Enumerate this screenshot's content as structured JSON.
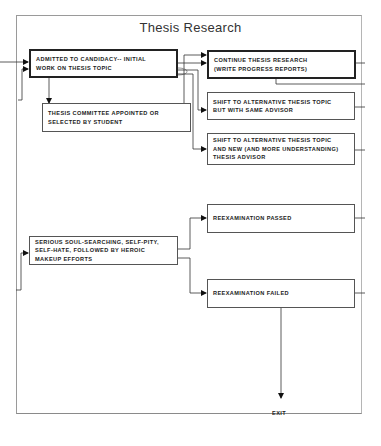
{
  "diagram": {
    "title": "Thesis Research",
    "nodes": [
      {
        "id": "admitted",
        "label": "ADMITTED TO CANDIDACY-- INITIAL\nWORK ON THESIS TOPIC"
      },
      {
        "id": "committee",
        "label": "THESIS COMMITTEE APPOINTED OR\nSELECTED BY STUDENT"
      },
      {
        "id": "continue",
        "label": "CONTINUE THESIS RESEARCH\n(WRITE PROGRESS REPORTS)"
      },
      {
        "id": "shift_same",
        "label": "SHIFT TO ALTERNATIVE THESIS TOPIC\nBUT WITH SAME ADVISOR"
      },
      {
        "id": "shift_new",
        "label": "SHIFT TO ALTERNATIVE THESIS TOPIC\nAND NEW (AND MORE UNDERSTANDING)\nTHESIS ADVISOR"
      },
      {
        "id": "soul",
        "label": "SERIOUS SOUL-SEARCHING, SELF-PITY,\nSELF-HATE, FOLLOWED BY HEROIC\nMAKEUP EFFORTS"
      },
      {
        "id": "passed",
        "label": "REEXAMINATION PASSED"
      },
      {
        "id": "failed",
        "label": "REEXAMINATION FAILED"
      }
    ],
    "exit_label": "EXIT",
    "edges": [
      {
        "from": "external",
        "to": "admitted"
      },
      {
        "from": "admitted",
        "to": "committee"
      },
      {
        "from": "admitted",
        "to": "continue"
      },
      {
        "from": "committee",
        "to": "continue"
      },
      {
        "from": "admitted",
        "to": "shift_same"
      },
      {
        "from": "admitted",
        "to": "shift_new"
      },
      {
        "from": "soul",
        "to": "passed"
      },
      {
        "from": "soul",
        "to": "failed"
      },
      {
        "from": "failed",
        "to": "exit"
      }
    ]
  }
}
